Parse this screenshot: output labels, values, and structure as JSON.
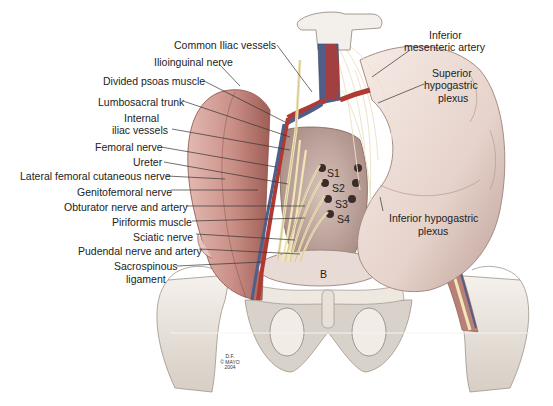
{
  "figure": {
    "type": "anatomical-illustration",
    "credit": [
      "D.F.",
      "© MAYO",
      "2004"
    ]
  },
  "labels_left": [
    {
      "text": "Common Iliac vessels",
      "x": 174,
      "y": 39,
      "align": "left",
      "line": [
        [
          277,
          45
        ],
        [
          312,
          92
        ]
      ]
    },
    {
      "text": "Ilioinguinal nerve",
      "x": 154,
      "y": 56,
      "align": "left",
      "line": [
        [
          219,
          64
        ],
        [
          240,
          86
        ]
      ]
    },
    {
      "text": "Divided psoas muscle",
      "x": 103,
      "y": 75,
      "align": "left",
      "line": [
        [
          204,
          81
        ],
        [
          285,
          122
        ]
      ]
    },
    {
      "text": "Lumbosacral trunk",
      "x": 98,
      "y": 96,
      "align": "left",
      "line": [
        [
          183,
          101
        ],
        [
          290,
          137
        ]
      ]
    },
    {
      "text": "Internal",
      "x": 124,
      "y": 112,
      "align": "left",
      "line": null
    },
    {
      "text": "iliac vessels",
      "x": 112,
      "y": 124,
      "align": "left",
      "line": [
        [
          172,
          129
        ],
        [
          290,
          150
        ]
      ]
    },
    {
      "text": "Femoral nerve",
      "x": 95,
      "y": 141,
      "align": "left",
      "line": [
        [
          161,
          147
        ],
        [
          276,
          167
        ]
      ]
    },
    {
      "text": "Ureter",
      "x": 133,
      "y": 156,
      "align": "left",
      "line": [
        [
          164,
          162
        ],
        [
          288,
          184
        ]
      ]
    },
    {
      "text": "Lateral femoral cutaneous nerve",
      "x": 20,
      "y": 170,
      "align": "left",
      "line": [
        [
          167,
          176
        ],
        [
          225,
          179
        ]
      ]
    },
    {
      "text": "Genitofemoral nerve",
      "x": 77,
      "y": 186,
      "align": "left",
      "line": [
        [
          171,
          190
        ],
        [
          258,
          190
        ]
      ]
    },
    {
      "text": "Obturator nerve and artery",
      "x": 64,
      "y": 201,
      "align": "left",
      "line": [
        [
          186,
          206
        ],
        [
          305,
          206
        ]
      ]
    },
    {
      "text": "Piriformis muscle",
      "x": 112,
      "y": 216,
      "align": "left",
      "line": [
        [
          192,
          221
        ],
        [
          305,
          218
        ]
      ]
    },
    {
      "text": "Sciatic nerve",
      "x": 133,
      "y": 231,
      "align": "left",
      "line": [
        [
          196,
          234
        ],
        [
          295,
          240
        ]
      ]
    },
    {
      "text": "Pudendal nerve and artery",
      "x": 78,
      "y": 245,
      "align": "left",
      "line": [
        [
          199,
          249
        ],
        [
          300,
          254
        ]
      ]
    },
    {
      "text": "Sacrospinous",
      "x": 114,
      "y": 260,
      "align": "left",
      "line": [
        [
          177,
          266
        ],
        [
          262,
          262
        ]
      ]
    },
    {
      "text": "ligament",
      "x": 126,
      "y": 273,
      "align": "left",
      "line": null
    }
  ],
  "labels_right": [
    {
      "text": "Inferior",
      "x": 429,
      "y": 29,
      "align": "center",
      "line": null
    },
    {
      "text": "mesenteric artery",
      "x": 404,
      "y": 41,
      "align": "center",
      "line": [
        [
          410,
          50
        ],
        [
          372,
          77
        ]
      ]
    },
    {
      "text": "Superior",
      "x": 432,
      "y": 67,
      "align": "center",
      "line": null
    },
    {
      "text": "hypogastric",
      "x": 424,
      "y": 79,
      "align": "center",
      "line": [
        [
          424,
          84
        ],
        [
          378,
          103
        ]
      ]
    },
    {
      "text": "plexus",
      "x": 438,
      "y": 92,
      "align": "center",
      "line": null
    },
    {
      "text": "Inferior hypogastric",
      "x": 389,
      "y": 212,
      "align": "left",
      "line": [
        [
          383,
          211
        ],
        [
          380,
          197
        ]
      ]
    },
    {
      "text": "plexus",
      "x": 418,
      "y": 225,
      "align": "left",
      "line": null
    }
  ],
  "markers": [
    {
      "text": "S1",
      "x": 327,
      "y": 167
    },
    {
      "text": "S2",
      "x": 332,
      "y": 182
    },
    {
      "text": "S3",
      "x": 335,
      "y": 198
    },
    {
      "text": "S4",
      "x": 337,
      "y": 213
    },
    {
      "text": "B",
      "x": 320,
      "y": 268
    }
  ],
  "colors": {
    "background": "#ffffff",
    "muscle": "#c98f86",
    "muscle_dark": "#a8655c",
    "bone": "#ece6df",
    "bone_shade": "#cfc6bc",
    "bowel": "#ead9d2",
    "bowel_shade": "#c9aea6",
    "artery": "#b03a32",
    "vein": "#4f5f8a",
    "nerve": "#f1e6b8",
    "bladder": "#e4d5cf",
    "label": "#222222",
    "leader": "#333333"
  }
}
